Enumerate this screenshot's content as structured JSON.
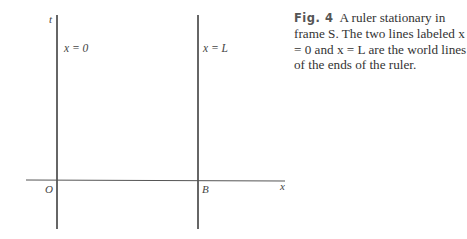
{
  "figure": {
    "axes": {
      "t_label": "t",
      "x_label": "x",
      "origin_label": "O",
      "point_b_label": "B"
    },
    "world_lines": [
      {
        "label": "x = 0"
      },
      {
        "label": "x = L"
      }
    ],
    "caption": {
      "figure_number": "Fig. 4",
      "text": "A ruler stationary in frame S. The two lines labeled x = 0 and x = L are the world lines of the ends of the ruler."
    }
  }
}
